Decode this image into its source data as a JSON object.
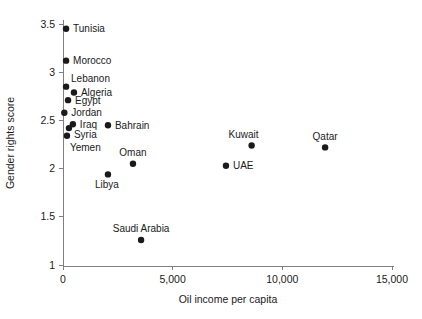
{
  "chart_data": {
    "type": "scatter",
    "title": "",
    "xlabel": "Oil income per capita",
    "ylabel": "Gender rights score",
    "xlim": [
      0,
      15500
    ],
    "ylim": [
      1,
      3.6
    ],
    "grid": false,
    "legend": "none",
    "xticks": [
      {
        "value": 0,
        "label": "0"
      },
      {
        "value": 5000,
        "label": "5,000"
      },
      {
        "value": 10000,
        "label": "10,000"
      },
      {
        "value": 15000,
        "label": "15,000"
      }
    ],
    "yticks": [
      {
        "value": 1,
        "label": "1"
      },
      {
        "value": 1.5,
        "label": "1.5"
      },
      {
        "value": 2,
        "label": "2"
      },
      {
        "value": 2.5,
        "label": "2.5"
      },
      {
        "value": 3,
        "label": "3"
      },
      {
        "value": 3.5,
        "label": "3.5"
      }
    ],
    "points": [
      {
        "name": "Tunisia",
        "x": 140,
        "y": 3.45,
        "label": "Tunisia",
        "anchor": "start",
        "dx": 7,
        "dy": 3.5
      },
      {
        "name": "Morocco",
        "x": 140,
        "y": 3.12,
        "label": "Morocco",
        "anchor": "start",
        "dx": 7,
        "dy": 3.5
      },
      {
        "name": "Lebanon",
        "x": 140,
        "y": 2.85,
        "label": "Lebanon",
        "anchor": "start",
        "dx": 5,
        "dy": -5
      },
      {
        "name": "Algeria",
        "x": 500,
        "y": 2.79,
        "label": "Algeria",
        "anchor": "start",
        "dx": 7,
        "dy": 3.5
      },
      {
        "name": "Egypt",
        "x": 230,
        "y": 2.71,
        "label": "Egypt",
        "anchor": "start",
        "dx": 7,
        "dy": 3.5
      },
      {
        "name": "Jordan",
        "x": 60,
        "y": 2.58,
        "label": "Jordan",
        "anchor": "start",
        "dx": 7,
        "dy": 3.5
      },
      {
        "name": "Iraq",
        "x": 450,
        "y": 2.46,
        "label": "Iraq",
        "anchor": "start",
        "dx": 7,
        "dy": 3.5
      },
      {
        "name": "Syria",
        "x": 270,
        "y": 2.42,
        "label": "Syria",
        "anchor": "start",
        "dx": 5,
        "dy": 10
      },
      {
        "name": "Yemen",
        "x": 180,
        "y": 2.34,
        "label": "Yemen",
        "anchor": "start",
        "dx": 3,
        "dy": 15
      },
      {
        "name": "Bahrain",
        "x": 2050,
        "y": 2.45,
        "label": "Bahrain",
        "anchor": "start",
        "dx": 7,
        "dy": 3.5
      },
      {
        "name": "Kuwait",
        "x": 8600,
        "y": 2.24,
        "label": "Kuwait",
        "anchor": "middle",
        "dx": -8,
        "dy": -7
      },
      {
        "name": "Qatar",
        "x": 11950,
        "y": 2.22,
        "label": "Qatar",
        "anchor": "middle",
        "dx": 0,
        "dy": -7
      },
      {
        "name": "UAE",
        "x": 7430,
        "y": 2.03,
        "label": "UAE",
        "anchor": "start",
        "dx": 7,
        "dy": 3.5
      },
      {
        "name": "Oman",
        "x": 3190,
        "y": 2.05,
        "label": "Oman",
        "anchor": "middle",
        "dx": 0,
        "dy": -8
      },
      {
        "name": "Libya",
        "x": 2050,
        "y": 1.94,
        "label": "Libya",
        "anchor": "middle",
        "dx": -1,
        "dy": 14
      },
      {
        "name": "Saudi Arabia",
        "x": 3560,
        "y": 1.26,
        "label": "Saudi Arabia",
        "anchor": "middle",
        "dx": 0,
        "dy": -8
      }
    ]
  },
  "colors": {
    "marker": "#1a1a1a",
    "axis": "#808080",
    "text": "#1a1a1a",
    "background": "#ffffff"
  }
}
